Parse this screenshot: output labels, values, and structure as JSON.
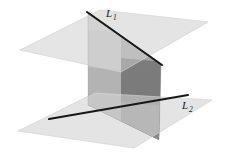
{
  "figure": {
    "background_color": "#ffffff",
    "width": 230,
    "height": 166
  },
  "labels": {
    "line1": {
      "base": "L",
      "subscript": "1",
      "text": "L1",
      "x": 106,
      "y": 16
    },
    "line2": {
      "base": "L",
      "subscript": "2",
      "text": "L2",
      "x": 182,
      "y": 108
    }
  },
  "colors": {
    "horizontal_plane": "#e4e4e4",
    "horizontal_plane_edge": "#d2d2d2",
    "vertical_plane_light": "#c9c9c9",
    "vertical_plane_mid": "#b0b0b0",
    "vertical_plane_dark": "#8e8e8e",
    "vertical_plane_darkest": "#6e6e6e",
    "line_stroke": "#171717",
    "label_color": "#171717"
  },
  "geometry": {
    "upper_plane": {
      "name": "upper-horizontal-plane",
      "points": "20,50 100,10 208,22 121,72"
    },
    "lower_plane": {
      "name": "lower-horizontal-plane",
      "points": "18,131 95,93 212,100 134,148"
    },
    "vertical_plane": {
      "name": "vertical-plane",
      "points": "88,14 161,64 159,140 88,105"
    },
    "vertical_above_upper": {
      "name": "vertical-plane-above-upper-plane",
      "points": "88,14 161,64 161,64 88,14"
    },
    "vertical_band_top": {
      "name": "vertical-plane-top-band",
      "points": "88,14 161,64 161,64 88,49"
    },
    "vertical_band_middle": {
      "name": "vertical-plane-middle-band",
      "points": "88,49 161,64 159,106 88,82"
    },
    "vertical_band_lower": {
      "name": "vertical-plane-lower-band",
      "points": "88,82 159,106 159,140 88,105"
    },
    "upper_overlap": {
      "name": "upper-plane-vertical-overlap",
      "points": "88,33 161,64 161,64 88,33"
    }
  },
  "lines": {
    "line1": {
      "name": "line-L1",
      "x1": 87,
      "y1": 12,
      "x2": 162,
      "y2": 65,
      "stroke_width": 2.1
    },
    "line2": {
      "name": "line-L2",
      "x1": 49,
      "y1": 119,
      "x2": 188,
      "y2": 95,
      "stroke_width": 2.1
    }
  }
}
